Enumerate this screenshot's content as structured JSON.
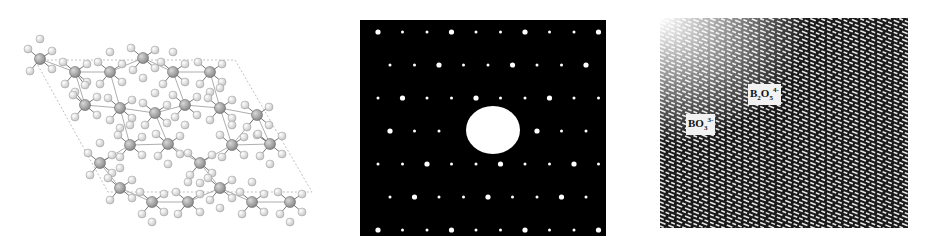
{
  "figure": {
    "panels": [
      {
        "id": "crystal-structure",
        "description": "Ball-and-stick crystal structure projection within a rhombic unit cell (dashed outline)",
        "atom_colors": {
          "metal": "#8c8c8c",
          "oxygen": "#f0f0f0",
          "bond": "#555555",
          "cell_outline": "#b0b0b0"
        }
      },
      {
        "id": "electron-diffraction",
        "description": "Selected-area electron diffraction pattern: rectangular lattice of bright spots on black with a large central beam stop",
        "background": "#000000",
        "spot_color": "#ffffff",
        "rows": 7,
        "columns": 10
      },
      {
        "id": "hrtem-image",
        "description": "High-resolution lattice image with diagonal fringes",
        "labels": [
          {
            "text": "B",
            "sub": "2",
            "mid": "O",
            "sub2": "5",
            "sup": "4-"
          },
          {
            "text": "BO",
            "sub": "3",
            "sup": "3-"
          }
        ]
      }
    ]
  }
}
